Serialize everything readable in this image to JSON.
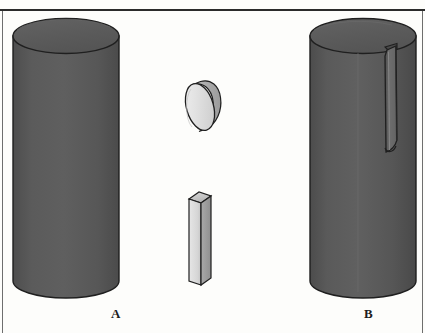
{
  "figure": {
    "background_color": "#fdfdfb",
    "rule_color": "#2b2b2b",
    "title": ""
  },
  "labels": {
    "left_cylinder": "A",
    "right_cylinder": "B"
  },
  "palette": {
    "cylinder_body": "#595959",
    "cylinder_body_shade": "#4a4a4a",
    "cylinder_top": "#5e5e5e",
    "cylinder_outline": "#1f1f1f",
    "slot_face": "#6b6b6b",
    "specimen_light": "#e3e3e3",
    "specimen_mid": "#c9c9c9",
    "specimen_dark": "#9a9a9a",
    "specimen_outline": "#1f1f1f",
    "background": "#fdfdfb"
  },
  "objects": [
    {
      "id": "cylinder-a",
      "name": "left-cylinder",
      "label": "A",
      "description": "plain solid cylinder",
      "has_slot": false
    },
    {
      "id": "disc-specimen",
      "name": "disc-specimen",
      "label": "",
      "description": "light gray disc specimen, tilted"
    },
    {
      "id": "bar-specimen",
      "name": "bar-specimen",
      "label": "",
      "description": "light gray rectangular bar specimen"
    },
    {
      "id": "cylinder-b",
      "name": "right-cylinder",
      "label": "B",
      "description": "cylinder with vertical slot cut from top rim",
      "has_slot": true
    }
  ]
}
